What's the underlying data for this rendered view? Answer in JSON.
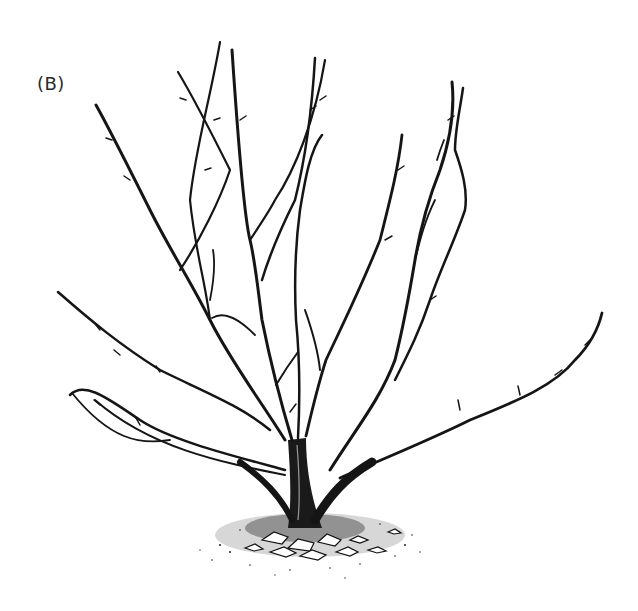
{
  "figure": {
    "label": "(B)",
    "ink_color": "#151515",
    "background": "#ffffff"
  }
}
